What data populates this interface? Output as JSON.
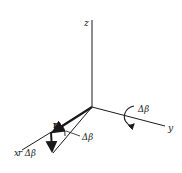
{
  "diagram": {
    "type": "3d-axes-rotation",
    "colors": {
      "ink": "#1a1a1a",
      "background": "#ffffff"
    },
    "axes": {
      "z_label": "z",
      "y_label": "y",
      "x_label": "x"
    },
    "vector": {
      "label": "r"
    },
    "displacement": {
      "label": "r Δβ"
    },
    "angle": {
      "label": "Δβ"
    },
    "rotation": {
      "label": "Δβ",
      "about_axis": "y"
    }
  }
}
